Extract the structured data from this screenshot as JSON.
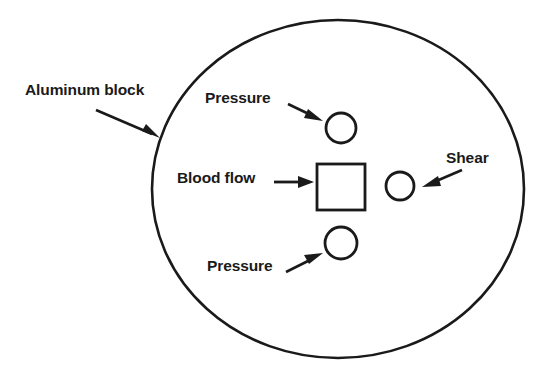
{
  "diagram": {
    "background_color": "#ffffff",
    "stroke_color": "#1a1a1a",
    "labels": {
      "aluminum_block": "Aluminum block",
      "pressure_top": "Pressure",
      "blood_flow": "Blood flow",
      "shear": "Shear",
      "pressure_bottom": "Pressure"
    },
    "shapes": {
      "outer_ellipse": {
        "name": "aluminum-block-outline",
        "cx": 338,
        "cy": 189,
        "rx": 186,
        "ry": 169
      },
      "pressure_sensor_top": {
        "name": "pressure-sensor-top",
        "cx": 341,
        "cy": 128,
        "r": 15
      },
      "pressure_sensor_bottom": {
        "name": "pressure-sensor-bottom",
        "cx": 341,
        "cy": 243,
        "r": 16
      },
      "shear_sensor": {
        "name": "shear-sensor",
        "cx": 400,
        "cy": 186,
        "r": 14
      },
      "center_square": {
        "name": "center-square-sensor",
        "x": 317,
        "y": 164,
        "width": 48,
        "height": 46
      }
    },
    "arrows": {
      "aluminum_block": {
        "x1": 96,
        "y1": 110,
        "x2": 160,
        "y2": 138
      },
      "pressure_top": {
        "x1": 288,
        "y1": 104,
        "x2": 322,
        "y2": 120
      },
      "blood_flow": {
        "x1": 274,
        "y1": 182,
        "x2": 313,
        "y2": 182
      },
      "shear": {
        "x1": 462,
        "y1": 170,
        "x2": 422,
        "y2": 187
      },
      "pressure_bottom": {
        "x1": 286,
        "y1": 272,
        "x2": 322,
        "y2": 253
      }
    }
  }
}
